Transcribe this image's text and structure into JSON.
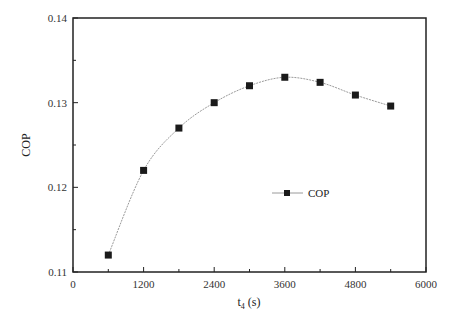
{
  "chart_data": {
    "type": "line",
    "title": "",
    "xlabel": "t",
    "xlabel_sub": "4",
    "xlabel_unit": " (s)",
    "ylabel": "COP",
    "xlim": [
      0,
      6000
    ],
    "ylim": [
      0.11,
      0.14
    ],
    "x_ticks": [
      0,
      1200,
      2400,
      3600,
      4800,
      6000
    ],
    "x_tick_labels": [
      "0",
      "1200",
      "2400",
      "3600",
      "4800",
      "6000"
    ],
    "y_ticks": [
      0.11,
      0.12,
      0.13,
      0.14
    ],
    "y_tick_labels": [
      "0.11",
      "0.12",
      "0.13",
      "0.14"
    ],
    "grid": false,
    "legend_position": "center-right",
    "x": [
      600,
      1200,
      1800,
      2400,
      3000,
      3600,
      4200,
      4800,
      5400
    ],
    "series": [
      {
        "name": "COP",
        "marker": "square",
        "values": [
          0.112,
          0.122,
          0.127,
          0.13,
          0.132,
          0.133,
          0.1324,
          0.1309,
          0.1296
        ]
      }
    ]
  },
  "colors": {
    "axis": "#222222",
    "line": "#9a9a9a",
    "marker": "#1a1a1a"
  }
}
